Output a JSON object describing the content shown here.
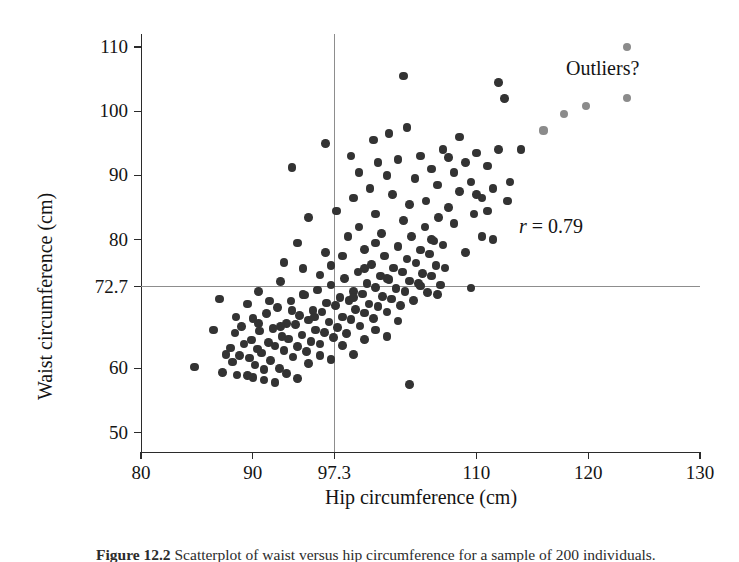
{
  "figure": {
    "caption_number": "Figure 12.2",
    "caption_text": "Scatterplot of waist versus hip circumference for a sample of 200 individuals."
  },
  "axes": {
    "x_title": "Hip circumference (cm)",
    "y_title": "Waist circumference (cm)",
    "x_ticks": [
      "80",
      "90",
      "97.3",
      "110",
      "120",
      "130"
    ],
    "y_ticks": [
      "50",
      "60",
      "72.7",
      "80",
      "90",
      "100",
      "110"
    ]
  },
  "annotations": {
    "r_symbol": "r",
    "r_text": " = 0.79",
    "r_full": "r = 0.79",
    "outliers_label": "Outliers?"
  },
  "colors": {
    "point": "#333333",
    "outlier_point": "#8b8b8b",
    "axis": "#2b2b2b",
    "reference_line": "#8d8d8d",
    "background": "#ffffff"
  },
  "chart_data": {
    "type": "scatter",
    "title": "",
    "xlabel": "Hip circumference (cm)",
    "ylabel": "Waist circumference (cm)",
    "xlim": [
      80,
      130
    ],
    "ylim": [
      47,
      112
    ],
    "x_ticks": [
      80,
      90,
      97.3,
      110,
      120,
      130
    ],
    "y_ticks": [
      50,
      60,
      72.7,
      80,
      90,
      100,
      110
    ],
    "grid": false,
    "legend": null,
    "correlation_r": 0.79,
    "reference_lines": {
      "x_mean": 97.3,
      "y_mean": 72.7
    },
    "annotations": [
      {
        "text": "r = 0.79",
        "x": 117.5,
        "y": 82.5
      },
      {
        "text": "Outliers?",
        "x": 121.5,
        "y": 103.5
      }
    ],
    "series": [
      {
        "name": "individuals",
        "color": "#333333",
        "points": [
          [
            84.8,
            60.2
          ],
          [
            87.3,
            59.4
          ],
          [
            87.6,
            62.2
          ],
          [
            88.0,
            63.2
          ],
          [
            88.2,
            61.0
          ],
          [
            88.4,
            65.5
          ],
          [
            88.6,
            59.0
          ],
          [
            88.8,
            62.0
          ],
          [
            89.0,
            66.5
          ],
          [
            89.2,
            63.8
          ],
          [
            89.5,
            58.9
          ],
          [
            89.7,
            61.6
          ],
          [
            89.9,
            64.4
          ],
          [
            90.0,
            67.8
          ],
          [
            90.2,
            60.5
          ],
          [
            90.4,
            63.0
          ],
          [
            90.6,
            65.8
          ],
          [
            90.8,
            62.4
          ],
          [
            91.0,
            59.8
          ],
          [
            91.2,
            68.5
          ],
          [
            91.4,
            64.0
          ],
          [
            91.6,
            61.2
          ],
          [
            91.8,
            66.2
          ],
          [
            92.0,
            63.5
          ],
          [
            92.2,
            69.5
          ],
          [
            92.4,
            60.0
          ],
          [
            92.6,
            65.0
          ],
          [
            92.8,
            62.8
          ],
          [
            93.0,
            67.0
          ],
          [
            93.2,
            64.6
          ],
          [
            93.4,
            70.5
          ],
          [
            93.6,
            61.8
          ],
          [
            93.8,
            66.8
          ],
          [
            94.0,
            63.4
          ],
          [
            94.2,
            68.2
          ],
          [
            94.4,
            65.2
          ],
          [
            94.6,
            71.4
          ],
          [
            94.8,
            62.6
          ],
          [
            95.0,
            67.5
          ],
          [
            95.2,
            64.2
          ],
          [
            95.4,
            69.0
          ],
          [
            95.6,
            66.0
          ],
          [
            95.8,
            72.2
          ],
          [
            96.0,
            63.8
          ],
          [
            96.2,
            68.8
          ],
          [
            96.4,
            65.6
          ],
          [
            96.6,
            70.2
          ],
          [
            96.8,
            67.2
          ],
          [
            97.0,
            73.0
          ],
          [
            97.2,
            64.8
          ],
          [
            97.4,
            69.8
          ],
          [
            97.6,
            66.4
          ],
          [
            97.8,
            71.0
          ],
          [
            98.0,
            68.0
          ],
          [
            98.2,
            74.0
          ],
          [
            98.4,
            65.4
          ],
          [
            98.6,
            70.6
          ],
          [
            98.8,
            67.6
          ],
          [
            99.0,
            72.0
          ],
          [
            99.2,
            69.2
          ],
          [
            99.4,
            75.0
          ],
          [
            99.6,
            66.6
          ],
          [
            99.8,
            71.6
          ],
          [
            100.0,
            68.6
          ],
          [
            100.2,
            73.2
          ],
          [
            100.4,
            70.0
          ],
          [
            100.6,
            76.2
          ],
          [
            100.8,
            67.8
          ],
          [
            101.0,
            72.6
          ],
          [
            101.2,
            69.6
          ],
          [
            101.4,
            74.4
          ],
          [
            101.6,
            71.2
          ],
          [
            101.8,
            77.5
          ],
          [
            102.0,
            68.8
          ],
          [
            102.2,
            73.8
          ],
          [
            102.4,
            70.8
          ],
          [
            102.6,
            75.6
          ],
          [
            102.8,
            72.4
          ],
          [
            103.0,
            79.0
          ],
          [
            103.2,
            69.8
          ],
          [
            103.4,
            75.0
          ],
          [
            103.6,
            72.0
          ],
          [
            103.8,
            77.0
          ],
          [
            104.0,
            73.6
          ],
          [
            104.2,
            80.5
          ],
          [
            104.4,
            70.6
          ],
          [
            104.6,
            76.4
          ],
          [
            104.8,
            73.2
          ],
          [
            105.0,
            78.4
          ],
          [
            105.2,
            74.8
          ],
          [
            105.4,
            82.0
          ],
          [
            105.6,
            71.8
          ],
          [
            105.8,
            77.8
          ],
          [
            106.0,
            74.4
          ],
          [
            106.2,
            79.8
          ],
          [
            106.4,
            76.0
          ],
          [
            106.6,
            83.5
          ],
          [
            106.8,
            73.0
          ],
          [
            107.0,
            79.2
          ],
          [
            107.2,
            75.6
          ],
          [
            93.5,
            91.2
          ],
          [
            99.0,
            86.5
          ],
          [
            100.5,
            88.0
          ],
          [
            101.0,
            84.0
          ],
          [
            102.0,
            90.0
          ],
          [
            102.5,
            87.0
          ],
          [
            103.0,
            92.5
          ],
          [
            104.0,
            85.5
          ],
          [
            104.5,
            89.5
          ],
          [
            105.0,
            93.0
          ],
          [
            105.5,
            86.0
          ],
          [
            106.0,
            91.0
          ],
          [
            106.5,
            88.5
          ],
          [
            107.0,
            94.0
          ],
          [
            107.5,
            85.0
          ],
          [
            108.0,
            90.5
          ],
          [
            108.5,
            87.5
          ],
          [
            109.0,
            92.0
          ],
          [
            109.5,
            89.0
          ],
          [
            110.0,
            93.5
          ],
          [
            110.5,
            86.5
          ],
          [
            111.0,
            91.5
          ],
          [
            111.5,
            88.0
          ],
          [
            112.0,
            94.0
          ],
          [
            112.5,
            102.0
          ],
          [
            112.0,
            104.5
          ],
          [
            103.5,
            105.5
          ],
          [
            96.5,
            95.0
          ],
          [
            98.5,
            80.5
          ],
          [
            99.5,
            82.0
          ],
          [
            100.0,
            78.5
          ],
          [
            101.5,
            81.0
          ],
          [
            103.5,
            83.0
          ],
          [
            106.0,
            80.0
          ],
          [
            108.0,
            82.5
          ],
          [
            109.0,
            78.0
          ],
          [
            110.5,
            80.5
          ],
          [
            111.0,
            84.5
          ],
          [
            113.0,
            89.0
          ],
          [
            114.0,
            94.0
          ],
          [
            90.5,
            72.0
          ],
          [
            92.5,
            73.5
          ],
          [
            94.5,
            71.5
          ],
          [
            96.0,
            74.5
          ],
          [
            97.0,
            76.0
          ],
          [
            98.0,
            77.5
          ],
          [
            99.0,
            71.0
          ],
          [
            100.0,
            75.5
          ],
          [
            101.0,
            79.5
          ],
          [
            102.0,
            74.0
          ],
          [
            105.0,
            72.8
          ],
          [
            106.5,
            71.5
          ],
          [
            109.5,
            72.5
          ],
          [
            104.0,
            57.5
          ],
          [
            92.0,
            57.8
          ],
          [
            91.0,
            58.2
          ],
          [
            90.0,
            58.6
          ],
          [
            93.0,
            59.2
          ],
          [
            94.0,
            58.4
          ],
          [
            95.0,
            60.8
          ],
          [
            96.0,
            62.0
          ],
          [
            97.0,
            61.4
          ],
          [
            98.0,
            63.6
          ],
          [
            99.0,
            62.2
          ],
          [
            100.0,
            64.5
          ],
          [
            101.0,
            66.0
          ],
          [
            102.0,
            65.0
          ],
          [
            103.0,
            67.4
          ],
          [
            86.5,
            66.0
          ],
          [
            87.0,
            70.8
          ],
          [
            89.5,
            70.0
          ],
          [
            91.5,
            70.5
          ],
          [
            93.5,
            69.0
          ],
          [
            95.5,
            68.0
          ],
          [
            88.5,
            68.0
          ],
          [
            90.5,
            67.0
          ],
          [
            92.5,
            66.5
          ],
          [
            94.5,
            75.5
          ],
          [
            96.5,
            78.0
          ],
          [
            94.0,
            79.5
          ],
          [
            92.8,
            76.5
          ],
          [
            95.0,
            83.5
          ],
          [
            97.5,
            84.5
          ],
          [
            99.5,
            90.5
          ],
          [
            100.8,
            95.5
          ],
          [
            108.5,
            96.0
          ],
          [
            110.0,
            87.0
          ],
          [
            102.2,
            96.5
          ],
          [
            103.8,
            97.5
          ],
          [
            98.8,
            93.0
          ],
          [
            101.2,
            92.0
          ],
          [
            107.5,
            92.8
          ],
          [
            109.8,
            84.0
          ],
          [
            111.5,
            80.0
          ],
          [
            112.8,
            86.0
          ]
        ]
      },
      {
        "name": "outliers",
        "color": "#8b8b8b",
        "points": [
          [
            119.8,
            100.8
          ],
          [
            123.5,
            110.0
          ],
          [
            123.5,
            102.0
          ],
          [
            116.0,
            97.0
          ],
          [
            117.8,
            99.5
          ]
        ]
      }
    ]
  }
}
